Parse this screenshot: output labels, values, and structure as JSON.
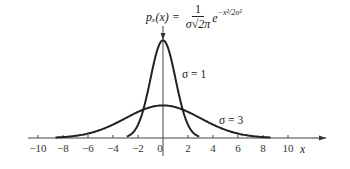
{
  "chart_data": {
    "type": "line",
    "title": "",
    "formula": {
      "lhs": "p_x(x) =",
      "numerator": "1",
      "denominator": "σ√(2π)",
      "exponent_base": "e",
      "exponent": "−x²/2σ²"
    },
    "xlabel": "x",
    "ylabel": "",
    "xlim": [
      -10,
      10
    ],
    "x_ticks": [
      -10,
      -8,
      -6,
      -4,
      -2,
      0,
      2,
      4,
      6,
      8,
      10
    ],
    "x_tick_labels": [
      "−10",
      "−8",
      "−6",
      "−4",
      "−2",
      "0",
      "2",
      "4",
      "6",
      "8",
      "10"
    ],
    "grid": false,
    "legend": "inline annotations",
    "series": [
      {
        "name": "σ = 1",
        "sigma": 1,
        "x": [
          -3,
          -2,
          -1,
          0,
          1,
          2,
          3
        ],
        "values": [
          0.0044,
          0.054,
          0.242,
          0.399,
          0.242,
          0.054,
          0.0044
        ]
      },
      {
        "name": "σ = 3",
        "sigma": 3,
        "x": [
          -9,
          -6,
          -3,
          0,
          3,
          6,
          9
        ],
        "values": [
          0.0015,
          0.018,
          0.081,
          0.133,
          0.081,
          0.018,
          0.0015
        ]
      }
    ],
    "annotations": [
      {
        "text": "σ = 1",
        "near": "narrow curve"
      },
      {
        "text": "σ = 3",
        "near": "wide curve"
      }
    ]
  },
  "labels": {
    "sigma1": "σ = 1",
    "sigma3": "σ = 3",
    "x_axis": "x",
    "formula_lhs": "pₓ(x) =",
    "formula_num": "1",
    "formula_den": "σ√2π",
    "formula_e": "e",
    "formula_exp": "−x²/2σ²"
  }
}
